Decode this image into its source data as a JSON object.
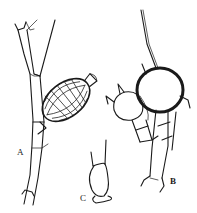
{
  "figure": {
    "labels": {
      "a": "A",
      "b": "B",
      "c": "C"
    },
    "ink_color": "#1a1a1a",
    "background": "#ffffff"
  }
}
